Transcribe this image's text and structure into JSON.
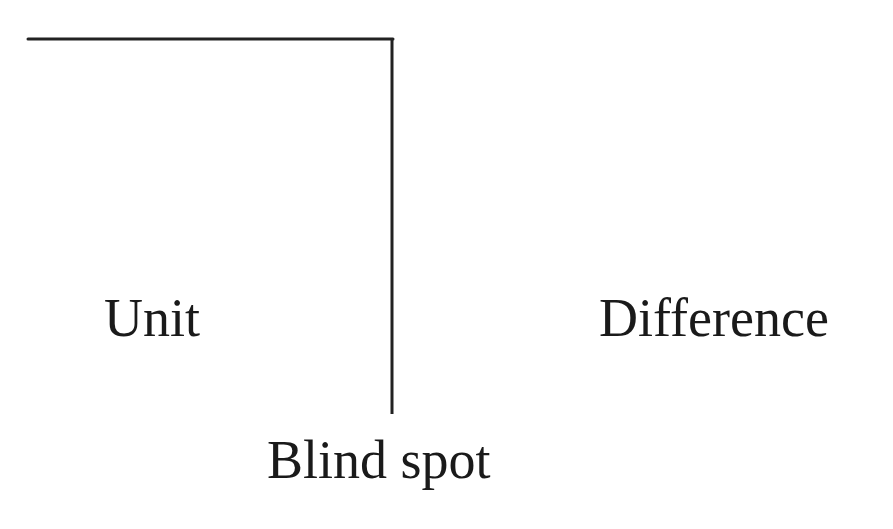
{
  "diagram": {
    "labels": {
      "unit": "Unit",
      "difference": "Difference",
      "blind_spot": "Blind spot"
    },
    "lines": {
      "color": "#222222",
      "horizontal": {
        "x1": 28,
        "y1": 39,
        "x2": 393,
        "y2": 39
      },
      "vertical": {
        "x1": 392,
        "y1": 39,
        "x2": 392,
        "y2": 414
      }
    }
  }
}
